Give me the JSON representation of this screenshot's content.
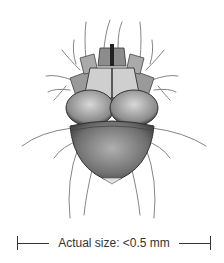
{
  "figure": {
    "alt": "Illustration of a mite viewed from above"
  },
  "scale_bar": {
    "label": "Actual size: <0.5 mm"
  }
}
